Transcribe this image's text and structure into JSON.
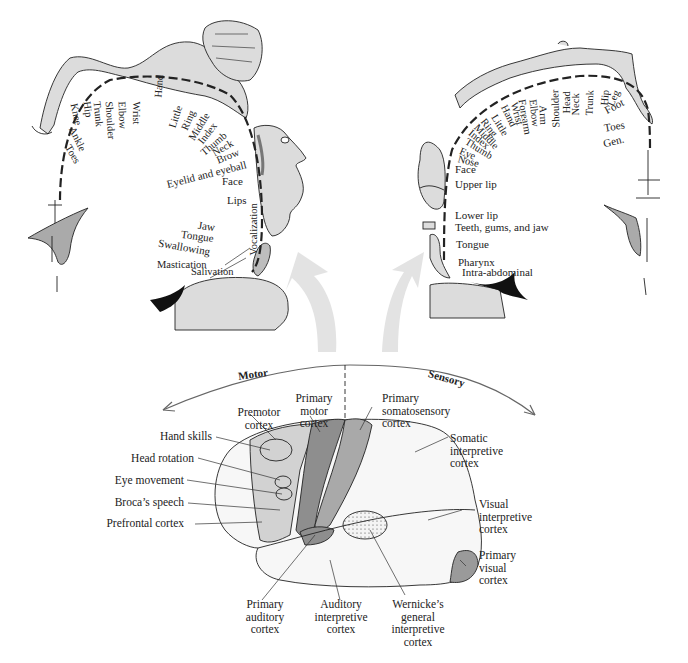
{
  "figure": {
    "colors": {
      "ink": "#222222",
      "body_fill": "#dcdcdc",
      "arrow_fill": "#e3e3e3",
      "primary_motor": "#8e8e8e",
      "somatosensory": "#a9a9a9",
      "premotor": "#d2d2d2",
      "visual": "#9a9a9a"
    },
    "motor_homunculus": {
      "labels": [
        "Toes",
        "Ankle",
        "Knee",
        "Hip",
        "Trunk",
        "Shoulder",
        "Elbow",
        "Wrist",
        "Hand",
        "Little",
        "Ring",
        "Middle",
        "Index",
        "Thumb",
        "Neck",
        "Brow",
        "Eyelid and eyeball",
        "Face",
        "Lips",
        "Jaw",
        "Tongue",
        "Swallowing",
        "Mastication",
        "Salivation",
        "Vocalization"
      ]
    },
    "sensory_homunculus": {
      "labels": [
        "Gen.",
        "Toes",
        "Foot",
        "Leg",
        "Hip",
        "Trunk",
        "Neck",
        "Head",
        "Shoulder",
        "Arm",
        "Elbow",
        "Forearm",
        "Wrist",
        "Hand",
        "Little",
        "Ring",
        "Middle",
        "Index",
        "Thumb",
        "Eye",
        "Nose",
        "Face",
        "Upper lip",
        "Lower lip",
        "Teeth, gums, and jaw",
        "Tongue",
        "Pharynx",
        "Intra-abdominal"
      ]
    },
    "brain": {
      "axis_left": "Motor",
      "axis_right": "Sensory",
      "left_labels": [
        "Hand skills",
        "Head rotation",
        "Eye movement",
        "Broca’s speech",
        "Prefrontal cortex"
      ],
      "top_labels": {
        "premotor": "Premotor\ncortex",
        "primary_motor": "Primary\nmotor\ncortex",
        "somatosensory": "Primary\nsomatosensory\ncortex"
      },
      "right_labels": {
        "somatic": "Somatic\ninterpretive\ncortex",
        "visual_interp": "Visual\ninterpretive\ncortex",
        "primary_visual": "Primary\nvisual\ncortex"
      },
      "bottom_labels": {
        "auditory": "Primary\nauditory\ncortex",
        "auditory_interp": "Auditory\ninterpretive\ncortex",
        "wernicke": "Wernicke’s\ngeneral\ninterpretive\ncortex"
      }
    }
  }
}
